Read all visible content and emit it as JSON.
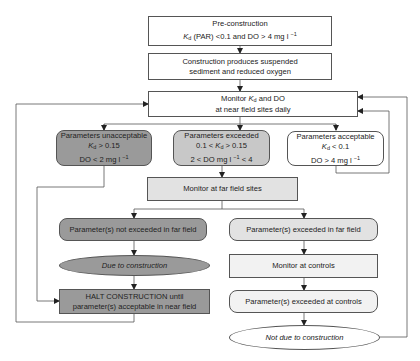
{
  "diagram": {
    "type": "flowchart",
    "nodes": {
      "pre_construction": {
        "title": "Pre-construction",
        "line2_prefix": "K",
        "line2_sub": "d",
        "line2_rest": " (PAR) <0.1 and DO > 4 mg l",
        "line2_sup": "−1"
      },
      "construction": {
        "line1": "Construction produces suspended",
        "line2": "sediment and reduced oxygen"
      },
      "monitor_near": {
        "line1_prefix": "Monitor ",
        "line1_k": "K",
        "line1_sub": "d",
        "line1_rest": " and DO",
        "line2": "at near field sites daily"
      },
      "unacceptable": {
        "title": "Parameters unacceptable",
        "k": "K",
        "k_sub": "d",
        "k_rest": " > 0.15",
        "do_line": "DO < 2 mg l",
        "do_sup": "−1"
      },
      "exceeded": {
        "title": "Parameters exceeded",
        "k_prefix": "0.1 < ",
        "k": "K",
        "k_sub": "d",
        "k_rest": " > 0.15",
        "do_line": "2 < DO mg l",
        "do_sup": "−1",
        "do_rest": " < 4"
      },
      "acceptable": {
        "title": "Parameters acceptable",
        "k": "K",
        "k_sub": "d",
        "k_rest": " < 0.1",
        "do_line": "DO > 4 mg l",
        "do_sup": "−1"
      },
      "monitor_far": {
        "label": "Monitor at far field sites"
      },
      "not_exceeded_far": {
        "label": "Parameter(s) not exceeded in far field"
      },
      "due_to_construction": {
        "label": "Due to construction"
      },
      "halt": {
        "line1": "HALT CONSTRUCTION until",
        "line2": "parameter(s) acceptable in near field"
      },
      "exceeded_far": {
        "label": "Parameter(s) exceeded in far field"
      },
      "monitor_controls": {
        "label": "Monitor at controls"
      },
      "exceeded_controls": {
        "label": "Parameter(s) exceeded at controls"
      },
      "not_due_to_construction": {
        "label": "Not due to construction"
      }
    },
    "colors": {
      "dark_fill": "#9a9a9a",
      "mid_fill": "#c8c8c8",
      "light_fill": "#e2e2e2",
      "white_fill": "#ffffff",
      "line": "#555555"
    }
  }
}
